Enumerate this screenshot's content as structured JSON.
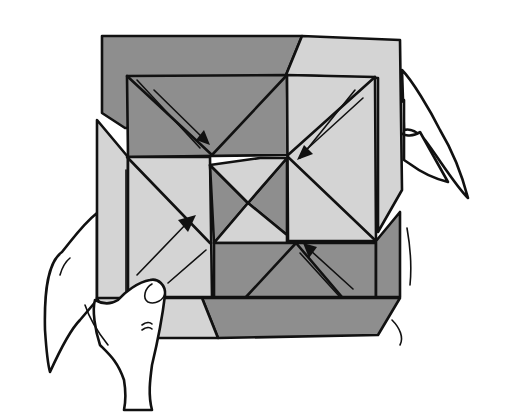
{
  "figure": {
    "colors": {
      "paper_light": "#d4d4d4",
      "paper_dark": "#8e8e8e",
      "outline": "#111111",
      "background": "#ffffff"
    },
    "arrows": [
      {
        "name": "fold-arrow-top-left",
        "direction": "down-right"
      },
      {
        "name": "fold-arrow-top-right",
        "direction": "down-left"
      },
      {
        "name": "fold-arrow-left",
        "direction": "up-right"
      },
      {
        "name": "fold-arrow-bottom-right",
        "direction": "up-left"
      }
    ],
    "hands": [
      "left-hand",
      "right-hand"
    ]
  }
}
